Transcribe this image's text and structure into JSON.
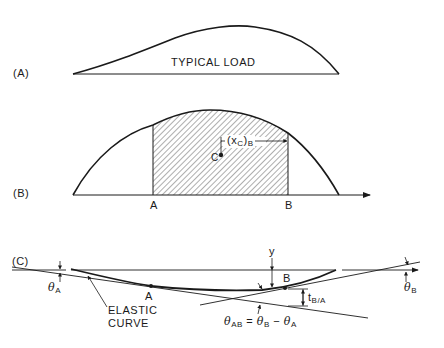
{
  "panels": {
    "a": {
      "label": "(A)",
      "load_text": "TYPICAL LOAD"
    },
    "b": {
      "label": "(B)",
      "point_a": "A",
      "point_b": "B",
      "centroid": "C",
      "dimension": {
        "open": "(x",
        "sub": "C",
        "close": ")",
        "sub2": "B"
      }
    },
    "c": {
      "label": "(C)",
      "theta_a": {
        "sym": "θ",
        "sub": "A"
      },
      "theta_b": {
        "sym": "θ",
        "sub": "B"
      },
      "point_a": "A",
      "point_b": "B",
      "y_label": "y",
      "elastic_curve_line1": "ELASTIC",
      "elastic_curve_line2": "CURVE",
      "t_ba": {
        "sym": "t",
        "sub": "B/A"
      },
      "theta_ab_eq": {
        "lhs": "θ",
        "lhs_sub": "AB",
        "eq": " = ",
        "t1": "θ",
        "t1_sub": "B",
        "minus": " − ",
        "t2": "θ",
        "t2_sub": "A"
      }
    }
  },
  "colors": {
    "ink": "#1a1a1a",
    "background": "#ffffff"
  }
}
